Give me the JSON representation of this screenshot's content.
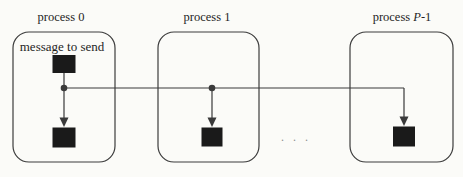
{
  "diagram": {
    "background_color": "#fbfbf8",
    "line_color": "#3a3a3a",
    "box_border_color": "#3c3c3c",
    "node_color": "#1a1a1a",
    "text_color": "#1f1f1f",
    "ellipsis": ". . .",
    "processes": [
      {
        "label": "process 0",
        "annotation": "message to send"
      },
      {
        "label": "process 1"
      },
      {
        "label_prefix": "process ",
        "label_var": "P",
        "label_suffix": "-1"
      }
    ]
  }
}
